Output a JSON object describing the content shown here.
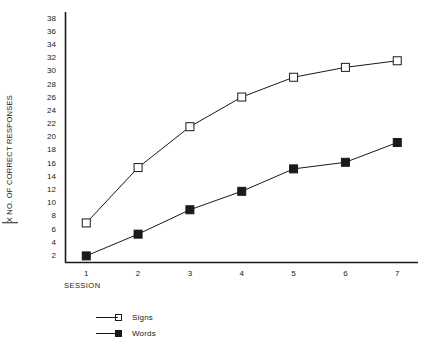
{
  "chart_data": {
    "type": "line",
    "title": "",
    "xlabel": "SESSION",
    "ylabel": "X NO. OF CORRECT RESPONSES",
    "ylabel_prefix": "X",
    "ylabel_rest": " NO. OF CORRECT RESPONSES",
    "categories": [
      "1",
      "2",
      "3",
      "4",
      "5",
      "6",
      "7"
    ],
    "x": [
      1,
      2,
      3,
      4,
      5,
      6,
      7
    ],
    "xlim": [
      0.6,
      7.4
    ],
    "ylim": [
      1,
      39
    ],
    "yticks": [
      2,
      4,
      6,
      8,
      10,
      12,
      14,
      16,
      18,
      20,
      22,
      24,
      26,
      28,
      30,
      32,
      34,
      36,
      38
    ],
    "xticks": [
      1,
      2,
      3,
      4,
      5,
      6,
      7
    ],
    "grid": false,
    "legend_position": "bottom-left",
    "series": [
      {
        "name": "Signs",
        "marker": "open-square",
        "color": "#1a1a1a",
        "values": [
          7,
          15.4,
          21.6,
          26.1,
          29.1,
          30.6,
          31.6
        ]
      },
      {
        "name": "Words",
        "marker": "filled-square",
        "color": "#1a1a1a",
        "values": [
          2,
          5.3,
          9,
          11.8,
          15.2,
          16.2,
          19.2
        ]
      }
    ]
  },
  "legend": {
    "items": [
      {
        "label": "Signs",
        "marker": "open-square"
      },
      {
        "label": "Words",
        "marker": "filled-square"
      }
    ]
  },
  "axes": {
    "x_axis_label": "SESSION",
    "y_axis_label": "X NO. OF CORRECT RESPONSES"
  },
  "colors": {
    "ink": "#1a1a1a",
    "background": "#ffffff"
  }
}
